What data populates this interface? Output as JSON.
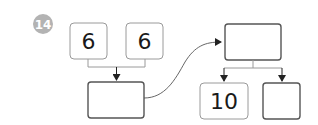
{
  "problem": {
    "number": "14",
    "badge_color": "#b3b3b3"
  },
  "boxes": {
    "left_top_a": {
      "value": "6",
      "filled": true
    },
    "left_top_b": {
      "value": "6",
      "filled": true
    },
    "left_result": {
      "value": "",
      "filled": false
    },
    "right_top": {
      "value": "",
      "filled": false
    },
    "right_bottom_a": {
      "value": "10",
      "filled": true
    },
    "right_bottom_b": {
      "value": "",
      "filled": false
    }
  },
  "colors": {
    "given_border": "#9a9a9a",
    "blank_border": "#555555",
    "connector": "#9a9a9a",
    "arrow": "#222222"
  }
}
